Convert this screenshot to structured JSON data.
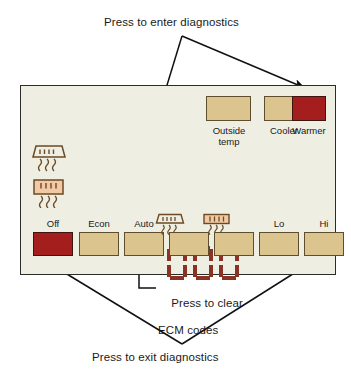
{
  "annotations": {
    "enter": "Press to enter diagnostics",
    "exit": "Press to exit diagnostics",
    "clear_line1": "Press to clear",
    "clear_line2": "ECM codes"
  },
  "panel": {
    "display_value": "000",
    "top_buttons": [
      {
        "label": "Outside\ntemp",
        "state": "inactive",
        "color": "#dcc48f"
      },
      {
        "label": "Cooler",
        "state": "inactive",
        "color": "#dcc48f"
      },
      {
        "label": "Warmer",
        "state": "active",
        "color": "#a51e1e"
      }
    ],
    "bottom_buttons": [
      {
        "label": "Off",
        "icon": null,
        "state": "active",
        "color": "#a51e1e"
      },
      {
        "label": "Econ",
        "icon": null,
        "state": "inactive",
        "color": "#dcc48f"
      },
      {
        "label": "Auto",
        "icon": null,
        "state": "inactive",
        "color": "#dcc48f"
      },
      {
        "label": "",
        "icon": "rear-defrost-icon",
        "state": "inactive",
        "color": "#dcc48f"
      },
      {
        "label": "",
        "icon": "front-defrost-icon",
        "state": "inactive",
        "color": "#dcc48f"
      },
      {
        "label": "Lo",
        "icon": null,
        "state": "inactive",
        "color": "#dcc48f"
      },
      {
        "label": "Hi",
        "icon": null,
        "state": "inactive",
        "color": "#dcc48f"
      }
    ],
    "indicator_icons": [
      {
        "name": "rear-defrost-indicator",
        "filled": false
      },
      {
        "name": "front-defrost-indicator",
        "filled": true
      }
    ]
  },
  "colors": {
    "panel_background": "#efeee2",
    "panel_border": "#2b2b28",
    "button_tan": "#dcc48f",
    "button_red": "#a51e1e",
    "display_segment": "#8a3324",
    "icon_fill": "#f2c9a4",
    "line": "#111111"
  }
}
